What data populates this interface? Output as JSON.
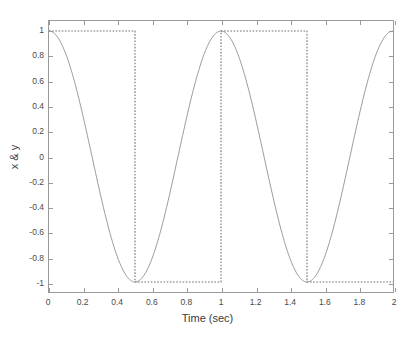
{
  "figure": {
    "background": "#ffffff",
    "axes_color": "#9a9a9a",
    "text_color": "#3a3a3a"
  },
  "axis": {
    "xlabel": "Time (sec)",
    "ylabel": "x & y",
    "title": "",
    "xticklabels": [
      "0",
      "0.2",
      "0.4",
      "0.6",
      "0.8",
      "1",
      "1.2",
      "1.4",
      "1.6",
      "1.8",
      "2"
    ],
    "yticklabels": [
      "1",
      "0.8",
      "0.6",
      "0.4",
      "0.2",
      "0",
      "-0.2",
      "-0.4",
      "-0.6",
      "-0.8",
      "-1"
    ]
  },
  "chart_data": {
    "type": "line",
    "title": "",
    "xlabel": "Time (sec)",
    "ylabel": "x & y",
    "xlim": [
      0,
      2
    ],
    "ylim": [
      -1.08,
      1.08
    ],
    "xticks": [
      0,
      0.2,
      0.4,
      0.6,
      0.8,
      1,
      1.2,
      1.4,
      1.6,
      1.8,
      2
    ],
    "yticks": [
      1,
      0.8,
      0.6,
      0.4,
      0.2,
      0,
      -0.2,
      -0.4,
      -0.6,
      -0.8,
      -1
    ],
    "grid": false,
    "legend": null,
    "series": [
      {
        "name": "x",
        "style": "solid",
        "color": "#8c8c8c",
        "linewidth": 0.8,
        "formula": "cos(2*pi*t)",
        "period_sec": 1.0,
        "amplitude": 1.0,
        "x": [
          0,
          0.05,
          0.1,
          0.15,
          0.2,
          0.25,
          0.3,
          0.35,
          0.4,
          0.45,
          0.5,
          0.55,
          0.6,
          0.65,
          0.7,
          0.75,
          0.8,
          0.85,
          0.9,
          0.95,
          1.0,
          1.05,
          1.1,
          1.15,
          1.2,
          1.25,
          1.3,
          1.35,
          1.4,
          1.45,
          1.5,
          1.55,
          1.6,
          1.65,
          1.7,
          1.75,
          1.8,
          1.85,
          1.9,
          1.95,
          2.0
        ],
        "y": [
          1.0,
          0.951,
          0.809,
          0.588,
          0.309,
          0.0,
          -0.309,
          -0.588,
          -0.809,
          -0.951,
          -1.0,
          -0.951,
          -0.809,
          -0.588,
          -0.309,
          0.0,
          0.309,
          0.588,
          0.809,
          0.951,
          1.0,
          0.951,
          0.809,
          0.588,
          0.309,
          0.0,
          -0.309,
          -0.588,
          -0.809,
          -0.951,
          -1.0,
          -0.951,
          -0.809,
          -0.588,
          -0.309,
          0.0,
          0.309,
          0.588,
          0.809,
          0.951,
          1.0
        ]
      },
      {
        "name": "y",
        "style": "dotted",
        "color": "#6e6e6e",
        "linewidth": 1.0,
        "formula": "sign(cos(2*pi*t))",
        "period_sec": 1.0,
        "amplitude": 1.0,
        "transitions_sec": [
          0.5,
          1.0,
          1.5
        ],
        "x": [
          0,
          0.5,
          0.5,
          1.0,
          1.0,
          1.5,
          1.5,
          2.0
        ],
        "y": [
          1,
          1,
          -1,
          -1,
          1,
          1,
          -1,
          -1
        ]
      }
    ]
  }
}
